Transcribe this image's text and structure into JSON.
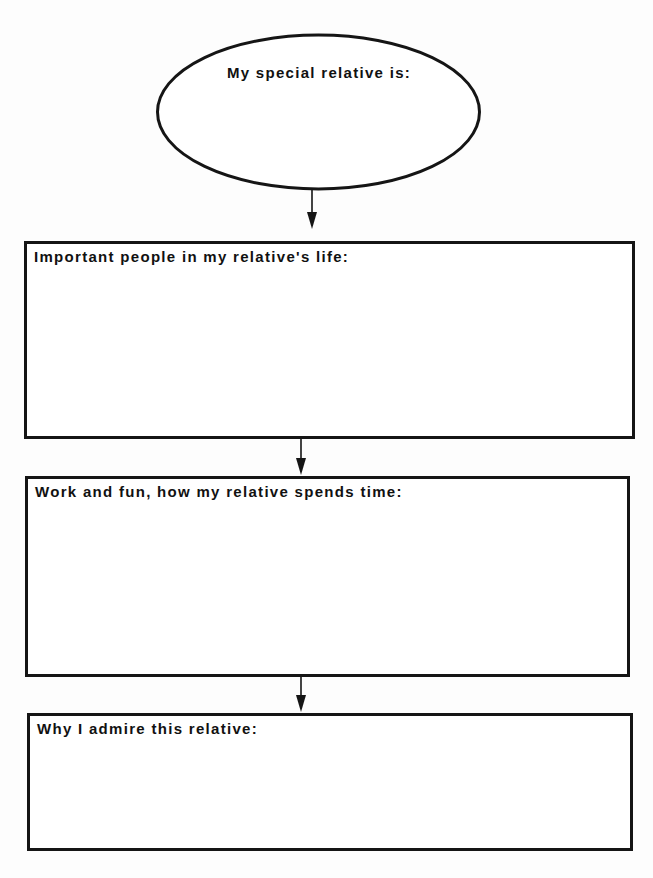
{
  "worksheet": {
    "top_ellipse": {
      "label": "My special relative is:"
    },
    "boxes": [
      {
        "label": "Important people in my relative's life:"
      },
      {
        "label": "Work and fun, how my relative spends time:"
      },
      {
        "label": "Why I admire this relative:"
      }
    ],
    "colors": {
      "ink": "#151515",
      "paper": "#ffffff"
    }
  }
}
